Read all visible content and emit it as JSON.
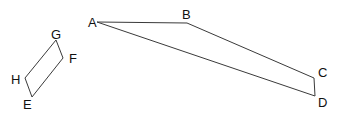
{
  "diagram": {
    "shapes": [
      {
        "name": "quadrilateral-ABCD",
        "vertices": [
          {
            "label": "A",
            "x": 97,
            "y": 22,
            "label_x": 88,
            "label_y": 27
          },
          {
            "label": "B",
            "x": 187,
            "y": 23,
            "label_x": 182,
            "label_y": 19
          },
          {
            "label": "C",
            "x": 314,
            "y": 78,
            "label_x": 318,
            "label_y": 77
          },
          {
            "label": "D",
            "x": 315,
            "y": 96,
            "label_x": 318,
            "label_y": 107
          }
        ]
      },
      {
        "name": "parallelogram-EFGH",
        "vertices": [
          {
            "label": "G",
            "x": 56,
            "y": 40,
            "label_x": 51,
            "label_y": 39
          },
          {
            "label": "F",
            "x": 63,
            "y": 58,
            "label_x": 69,
            "label_y": 63
          },
          {
            "label": "E",
            "x": 32,
            "y": 97,
            "label_x": 23,
            "label_y": 109
          },
          {
            "label": "H",
            "x": 25,
            "y": 78,
            "label_x": 12,
            "label_y": 84
          }
        ]
      }
    ],
    "labels": {
      "A": "A",
      "B": "B",
      "C": "C",
      "D": "D",
      "E": "E",
      "F": "F",
      "G": "G",
      "H": "H"
    },
    "colors": {
      "stroke": "#3a3a3a",
      "text": "#111111",
      "background": "#ffffff"
    }
  }
}
